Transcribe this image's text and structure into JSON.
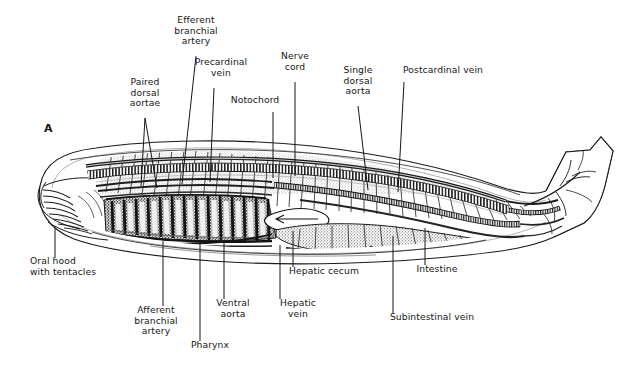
{
  "figure": {
    "panel_letter": "A",
    "organism": "amphioxus-lancelet-sagittal-section",
    "background_color": "#ffffff",
    "ink_color": "#161616"
  },
  "labels": {
    "top": [
      {
        "id": "efferent-branchial-artery",
        "text": "Efferent\nbranchial\nartery",
        "x": 196,
        "y": 20,
        "leader": {
          "x1": 196,
          "y1": 56,
          "x2": 182,
          "y2": 184
        }
      },
      {
        "id": "paired-dorsal-aortae",
        "text": "Paired\ndorsal\naortae",
        "x": 145,
        "y": 82,
        "leader": {
          "x1": 145,
          "y1": 118,
          "x2": 141,
          "y2": 186
        },
        "leader2": {
          "x1": 145,
          "y1": 118,
          "x2": 157,
          "y2": 188
        }
      },
      {
        "id": "precardinal-vein",
        "text": "Precardinal\nvein",
        "x": 221,
        "y": 62,
        "leader": {
          "x1": 214,
          "y1": 88,
          "x2": 210,
          "y2": 182
        }
      },
      {
        "id": "notochord",
        "text": "Notochord",
        "x": 255,
        "y": 100,
        "leader": {
          "x1": 273,
          "y1": 112,
          "x2": 273,
          "y2": 178
        }
      },
      {
        "id": "nerve-cord",
        "text": "Nerve\ncord",
        "x": 295,
        "y": 56,
        "leader": {
          "x1": 295,
          "y1": 82,
          "x2": 295,
          "y2": 176
        }
      },
      {
        "id": "single-dorsal-aorta",
        "text": "Single\ndorsal\naorta",
        "x": 358,
        "y": 70,
        "leader": {
          "x1": 358,
          "y1": 106,
          "x2": 368,
          "y2": 190
        }
      },
      {
        "id": "postcardinal-vein",
        "text": "Postcardinal vein",
        "x": 443,
        "y": 70,
        "leader": {
          "x1": 404,
          "y1": 82,
          "x2": 398,
          "y2": 192
        }
      }
    ],
    "bottom": [
      {
        "id": "oral-hood-with-tentacles",
        "text": "Oral hood\nwith tentacles",
        "x": 66,
        "y": 261,
        "leader": {
          "x1": 55,
          "y1": 228,
          "x2": 55,
          "y2": 258
        }
      },
      {
        "id": "afferent-branchial-artery",
        "text": "Afferent\nbranchial\nartery",
        "x": 155,
        "y": 310,
        "leader": {
          "x1": 163,
          "y1": 241,
          "x2": 163,
          "y2": 306
        }
      },
      {
        "id": "pharynx",
        "text": "Pharynx",
        "x": 210,
        "y": 345,
        "leader": {
          "x1": 200,
          "y1": 241,
          "x2": 200,
          "y2": 341
        }
      },
      {
        "id": "ventral-aorta",
        "text": "Ventral\naorta",
        "x": 232,
        "y": 303,
        "leader": {
          "x1": 224,
          "y1": 243,
          "x2": 224,
          "y2": 299
        }
      },
      {
        "id": "hepatic-vein",
        "text": "Hepatic\nvein",
        "x": 298,
        "y": 303,
        "leader": {
          "x1": 280,
          "y1": 245,
          "x2": 280,
          "y2": 299
        }
      },
      {
        "id": "hepatic-cecum",
        "text": "Hepatic cecum",
        "x": 320,
        "y": 271,
        "leader": {
          "x1": 293,
          "y1": 231,
          "x2": 293,
          "y2": 267
        }
      },
      {
        "id": "subintestinal-vein",
        "text": "Subintestinal vein",
        "x": 432,
        "y": 317,
        "leader": {
          "x1": 393,
          "y1": 236,
          "x2": 393,
          "y2": 313
        }
      },
      {
        "id": "intestine",
        "text": "Intestine",
        "x": 437,
        "y": 269,
        "leader": {
          "x1": 425,
          "y1": 228,
          "x2": 425,
          "y2": 265
        }
      }
    ]
  }
}
